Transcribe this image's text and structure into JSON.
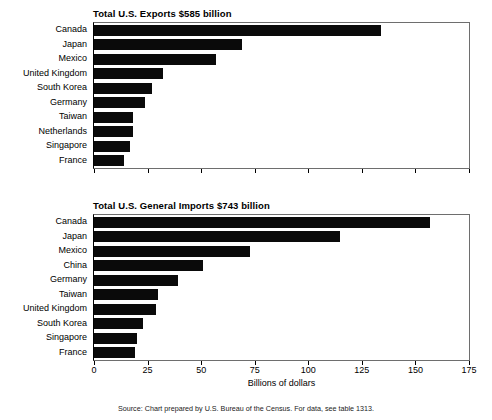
{
  "figure": {
    "axis_label": "Billions of dollars",
    "source_note": "Source: Chart prepared by U.S. Bureau of the Census. For data, see table 1313.",
    "bar_color": "#0a0a0a",
    "frame_color": "#6e6e6e"
  },
  "chart_data": [
    {
      "id": "exports",
      "type": "bar",
      "orientation": "horizontal",
      "title": "Total U.S. Exports $585 billion",
      "xlabel": "Billions of dollars",
      "ylabel": "",
      "xlim": [
        0,
        175
      ],
      "ticks": [
        0,
        25,
        50,
        75,
        100,
        125,
        150,
        175
      ],
      "tick_labels": [
        "0",
        "25",
        "50",
        "75",
        "100",
        "125",
        "150",
        "175"
      ],
      "grid": false,
      "legend": false,
      "categories": [
        "Canada",
        "Japan",
        "Mexico",
        "United Kingdom",
        "South Korea",
        "Germany",
        "Taiwan",
        "Netherlands",
        "Singapore",
        "France"
      ],
      "values": [
        134,
        69,
        57,
        32,
        27,
        24,
        18,
        18,
        17,
        14
      ]
    },
    {
      "id": "imports",
      "type": "bar",
      "orientation": "horizontal",
      "title": "Total U.S. General Imports $743 billion",
      "xlabel": "Billions of dollars",
      "ylabel": "",
      "xlim": [
        0,
        175
      ],
      "ticks": [
        0,
        25,
        50,
        75,
        100,
        125,
        150,
        175
      ],
      "tick_labels": [
        "0",
        "25",
        "50",
        "75",
        "100",
        "125",
        "150",
        "175"
      ],
      "grid": false,
      "legend": false,
      "categories": [
        "Canada",
        "Japan",
        "Mexico",
        "China",
        "Germany",
        "Taiwan",
        "United Kingdom",
        "South Korea",
        "Singapore",
        "France"
      ],
      "values": [
        157,
        115,
        73,
        51,
        39,
        30,
        29,
        23,
        20,
        19
      ]
    }
  ]
}
